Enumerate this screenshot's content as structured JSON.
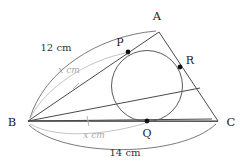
{
  "figure": {
    "type": "geometry-diagram",
    "shape": "triangle-with-incircle",
    "vertices": [
      {
        "id": "A",
        "label": "A",
        "x": 159,
        "y": 32,
        "label_x": 157,
        "label_y": 20
      },
      {
        "id": "B",
        "label": "B",
        "x": 28,
        "y": 121,
        "label_x": 12,
        "label_y": 126
      },
      {
        "id": "C",
        "label": "C",
        "x": 218,
        "y": 121,
        "label_x": 229,
        "label_y": 126
      }
    ],
    "tangency_points": [
      {
        "id": "P",
        "label": "P",
        "x": 128,
        "y": 52,
        "label_x": 120,
        "label_y": 46,
        "on_side": "AB"
      },
      {
        "id": "Q",
        "label": "Q",
        "x": 147,
        "y": 121,
        "label_x": 147,
        "label_y": 136,
        "on_side": "BC"
      },
      {
        "id": "R",
        "label": "R",
        "x": 180,
        "y": 67,
        "label_x": 189,
        "label_y": 64,
        "on_side": "AC"
      }
    ],
    "incircle": {
      "cx": 147,
      "cy": 86,
      "r": 35.5
    },
    "segments": [
      {
        "id": "AB",
        "from": "A",
        "to": "B",
        "style": "solid"
      },
      {
        "id": "BC",
        "from": "B",
        "to": "C",
        "style": "solid"
      },
      {
        "id": "CA",
        "from": "C",
        "to": "A",
        "style": "solid"
      },
      {
        "id": "BR",
        "from": "B",
        "to": "R",
        "style": "solid"
      }
    ],
    "measurements": [
      {
        "id": "AB-length",
        "label": "12 cm",
        "value": 12,
        "unit": "cm",
        "applies_to": "AB",
        "emphasis": "dark",
        "label_x": 56,
        "label_y": 48
      },
      {
        "id": "BP-length",
        "label": "x cm",
        "value": "x",
        "unit": "cm",
        "applies_to": "BP",
        "emphasis": "faint",
        "label_x": 69,
        "label_y": 72
      },
      {
        "id": "BQ-length",
        "label": "x cm",
        "value": "x",
        "unit": "cm",
        "applies_to": "BQ",
        "emphasis": "faint",
        "label_x": 94,
        "label_y": 137
      },
      {
        "id": "BC-length",
        "label": "14 cm",
        "value": 14,
        "unit": "cm",
        "applies_to": "BC",
        "emphasis": "dark",
        "label_x": 125,
        "label_y": 154
      }
    ],
    "congruence_ticks": [
      {
        "id": "tick-BP",
        "on_segment": "BP",
        "x": 76,
        "y": 86,
        "emphasis": "faint"
      },
      {
        "id": "tick-BQ",
        "on_segment": "BQ",
        "x": 88,
        "y": 121,
        "emphasis": "faint"
      }
    ],
    "colors": {
      "stroke_dark": "#4a4a4a",
      "stroke_arc": "#6b6b6b",
      "stroke_faint": "#bdbdbd",
      "text": "#1c1c1c",
      "text_faint": "#a9a9a9",
      "background": "#ffffff"
    }
  }
}
